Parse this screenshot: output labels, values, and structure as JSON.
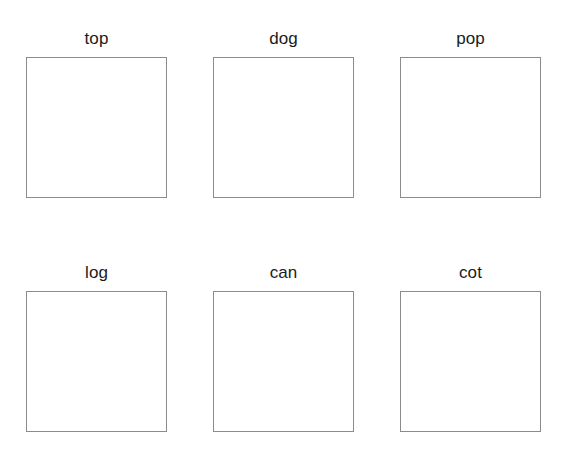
{
  "page": {
    "background_color": "#ffffff",
    "width": 564,
    "height": 451
  },
  "style": {
    "box_border_color": "#8c8c8c",
    "box_fill_color": "#ffffff",
    "label_color": "#1b1b1b"
  },
  "grid": {
    "rows": 2,
    "columns": 3,
    "box_width": 141,
    "box_height": 141,
    "rows_data": [
      {
        "row_name": "top-row",
        "cells": [
          {
            "label": "top",
            "box_content": ""
          },
          {
            "label": "dog",
            "box_content": ""
          },
          {
            "label": "pop",
            "box_content": ""
          }
        ]
      },
      {
        "row_name": "bottom-row",
        "cells": [
          {
            "label": "log",
            "box_content": ""
          },
          {
            "label": "can",
            "box_content": ""
          },
          {
            "label": "cot",
            "box_content": ""
          }
        ]
      }
    ]
  }
}
